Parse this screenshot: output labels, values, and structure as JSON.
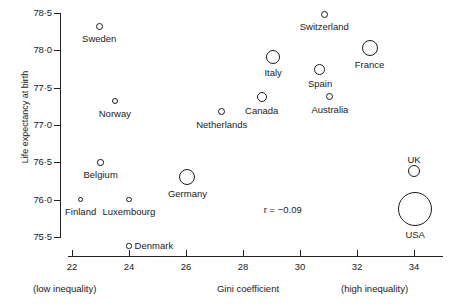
{
  "chart_data": {
    "type": "scatter",
    "title": "",
    "xlabel": "Gini coefficient",
    "ylabel": "Life expectancy at birth",
    "xlim": [
      21.6,
      35.0
    ],
    "ylim": [
      75.35,
      78.6
    ],
    "grid": false,
    "legend": null,
    "annotations": [
      {
        "text": "r = −0.09",
        "x": 29.5,
        "y": 75.86
      },
      {
        "text": "(low inequality)",
        "x": 22.0,
        "y": null
      },
      {
        "text": "(high inequality)",
        "x": 34.0,
        "y": null
      }
    ],
    "x_ticks": [
      22,
      24,
      26,
      28,
      30,
      32,
      34
    ],
    "x_tick_labels": [
      "22",
      "24",
      "26",
      "28",
      "30",
      "32",
      "34"
    ],
    "y_ticks": [
      75.5,
      76.0,
      76.5,
      77.0,
      77.5,
      78.0,
      78.5
    ],
    "y_tick_labels": [
      "75·5",
      "76·0",
      "76·5",
      "77·0",
      "77·5",
      "78·0",
      "78·5"
    ],
    "size_encodes": "population",
    "points": [
      {
        "label": "Sweden",
        "x": 22.95,
        "y": 78.32,
        "r": 3.5,
        "label_dx": 0,
        "label_dy": 7
      },
      {
        "label": "Switzerland",
        "x": 30.85,
        "y": 78.48,
        "r": 3.5,
        "label_dx": 0,
        "label_dy": 7
      },
      {
        "label": "France",
        "x": 32.45,
        "y": 78.03,
        "r": 8.0,
        "label_dx": 0,
        "label_dy": 11
      },
      {
        "label": "Italy",
        "x": 29.05,
        "y": 77.91,
        "r": 7.0,
        "label_dx": 0,
        "label_dy": 10
      },
      {
        "label": "Spain",
        "x": 30.7,
        "y": 77.75,
        "r": 5.5,
        "label_dx": 0,
        "label_dy": 9
      },
      {
        "label": "Norway",
        "x": 23.5,
        "y": 77.32,
        "r": 3.2,
        "label_dx": 0,
        "label_dy": 7
      },
      {
        "label": "Canada",
        "x": 28.65,
        "y": 77.38,
        "r": 5.0,
        "label_dx": 0,
        "label_dy": 8
      },
      {
        "label": "Australia",
        "x": 31.05,
        "y": 77.38,
        "r": 3.5,
        "label_dx": 0,
        "label_dy": 7
      },
      {
        "label": "Netherlands",
        "x": 27.25,
        "y": 77.18,
        "r": 3.5,
        "label_dx": 0,
        "label_dy": 7
      },
      {
        "label": "Belgium",
        "x": 23.0,
        "y": 76.5,
        "r": 3.2,
        "label_dx": 0,
        "label_dy": 7
      },
      {
        "label": "UK",
        "x": 34.0,
        "y": 76.38,
        "r": 6.0,
        "label_dx": 0,
        "label_dy": -17
      },
      {
        "label": "Germany",
        "x": 26.05,
        "y": 76.3,
        "r": 8.0,
        "label_dx": 0,
        "label_dy": 11
      },
      {
        "label": "Finland",
        "x": 22.3,
        "y": 76.0,
        "r": 2.6,
        "label_dx": 0,
        "label_dy": 6
      },
      {
        "label": "Luxembourg",
        "x": 24.0,
        "y": 76.0,
        "r": 2.6,
        "label_dx": 0,
        "label_dy": 6
      },
      {
        "label": "USA",
        "x": 34.05,
        "y": 75.88,
        "r": 17.0,
        "label_dx": 0,
        "label_dy": 20
      },
      {
        "label": "Denmark",
        "x": 24.0,
        "y": 75.38,
        "r": 2.6,
        "label_dx": 27,
        "label_dy": 0
      }
    ]
  }
}
